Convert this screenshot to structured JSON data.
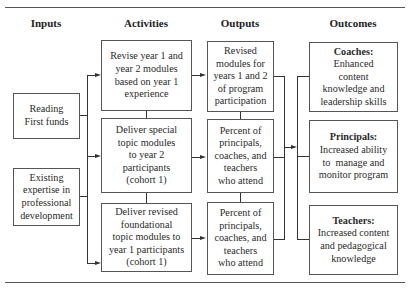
{
  "headers": {
    "inputs": "Inputs",
    "activities": "Activities",
    "outputs": "Outputs",
    "outcomes": "Outcomes"
  },
  "inputs": [
    {
      "lines": [
        "Reading",
        "First funds"
      ]
    },
    {
      "lines": [
        "Existing",
        "expertise in",
        "professional",
        "development"
      ]
    }
  ],
  "activities": [
    {
      "lines": [
        "Revise year 1 and",
        "year 2 modules",
        "based on year 1",
        "experience"
      ]
    },
    {
      "lines": [
        "Deliver special",
        "topic modules",
        "to year 2",
        "participants",
        "(cohort 1)"
      ]
    },
    {
      "lines": [
        "Deliver revised",
        "foundational",
        "topic modules to",
        "year 1 participants",
        "(cohort 1)"
      ]
    }
  ],
  "outputs": [
    {
      "lines": [
        "Revised",
        "modules for",
        "years 1 and 2",
        "of program",
        "participation"
      ]
    },
    {
      "lines": [
        "Percent of",
        "principals,",
        "coaches, and",
        "teachers",
        "who attend"
      ]
    },
    {
      "lines": [
        "Percent of",
        "principals,",
        "coaches, and",
        "teachers",
        "who attend"
      ]
    }
  ],
  "outcomes": [
    {
      "title": "Coaches:",
      "lines": [
        "Enhanced",
        "content",
        "knowledge and",
        "leadership skills"
      ]
    },
    {
      "title": "Principals:",
      "lines": [
        "Increased ability",
        "to  manage and",
        "monitor program"
      ]
    },
    {
      "title": "Teachers:",
      "lines": [
        "Increased content",
        "and pedagogical",
        "knowledge"
      ]
    }
  ],
  "colors": {
    "line": "#333333",
    "border": "#555555",
    "text": "#2a2a2a"
  }
}
